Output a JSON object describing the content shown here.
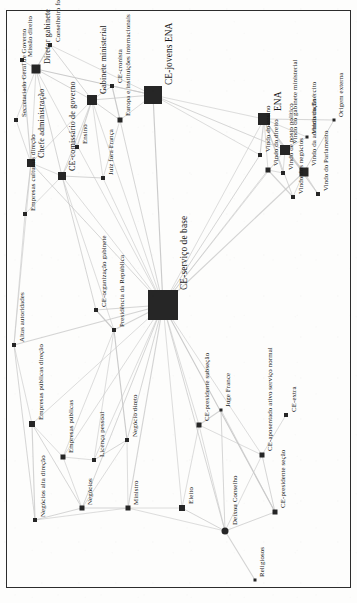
{
  "figure": {
    "type": "network-graph",
    "orientation_degrees": -90,
    "background_color": "#fdfdfc",
    "node_color": "#262626",
    "edge_color": "#c9c9c9",
    "frame_color": "#2c2c2c",
    "width": 357,
    "height": 603
  },
  "chart_data": {
    "type": "scatter",
    "title": "",
    "xlabel": "",
    "ylabel": "",
    "grid": false,
    "legend": "none",
    "nodes": [
      {
        "id": "missao-direito",
        "label": "Missão direito",
        "x": 22,
        "y": 60,
        "size": 4,
        "shape": "square",
        "label_size": "small",
        "lx": 27,
        "ly": 57
      },
      {
        "id": "secretariado-geral-governo",
        "label": "Secretariado Geral de Governo",
        "x": 16,
        "y": 120,
        "size": 4,
        "shape": "square",
        "label_size": "small",
        "lx": 21,
        "ly": 117
      },
      {
        "id": "chefe-administracao",
        "label": "Chefe administração",
        "x": 31,
        "y": 163,
        "size": 8,
        "shape": "square",
        "label_size": "med",
        "lx": 38,
        "ly": 158
      },
      {
        "id": "diretor-gabinete",
        "label": "Diretor gabinete",
        "x": 36,
        "y": 69,
        "size": 9,
        "shape": "square",
        "label_size": "med",
        "lx": 44,
        "ly": 64
      },
      {
        "id": "conselheiro-fora-ministerios",
        "label": "Conselheiro fora ministérios",
        "x": 50,
        "y": 45,
        "size": 4,
        "shape": "square",
        "label_size": "small",
        "lx": 55,
        "ly": 42
      },
      {
        "id": "empresas-culturais-direcao",
        "label": "Empresas culturais direção",
        "x": 25,
        "y": 214,
        "size": 4,
        "shape": "square",
        "label_size": "small",
        "lx": 30,
        "ly": 211
      },
      {
        "id": "ce-comissario-governo",
        "label": "CE-comissário de governo",
        "x": 62,
        "y": 176,
        "size": 8,
        "shape": "square",
        "label_size": "med",
        "lx": 69,
        "ly": 171
      },
      {
        "id": "ensino",
        "label": "Ensino",
        "x": 77,
        "y": 147,
        "size": 4,
        "shape": "square",
        "label_size": "small",
        "lx": 82,
        "ly": 144
      },
      {
        "id": "gabinete-ministerial",
        "label": "Gabinete ministerial",
        "x": 92,
        "y": 100,
        "size": 10,
        "shape": "square",
        "label_size": "med",
        "lx": 100,
        "ly": 94
      },
      {
        "id": "juiz-fora-franca",
        "label": "Juiz fora França",
        "x": 103,
        "y": 178,
        "size": 4,
        "shape": "square",
        "label_size": "small",
        "lx": 108,
        "ly": 175
      },
      {
        "id": "europa-instituicoes",
        "label": "Europa e instituições internacionais",
        "x": 120,
        "y": 120,
        "size": 5,
        "shape": "square",
        "label_size": "small",
        "lx": 125,
        "ly": 116
      },
      {
        "id": "ce-cronista",
        "label": "CE-cronista",
        "x": 112,
        "y": 86,
        "size": 4,
        "shape": "square",
        "label_size": "small",
        "lx": 117,
        "ly": 83
      },
      {
        "id": "ce-jovens-ena",
        "label": "CE-jovens ENA",
        "x": 153,
        "y": 95,
        "size": 18,
        "shape": "square",
        "label_size": "big",
        "lx": 165,
        "ly": 85
      },
      {
        "id": "ce-servico-de-base",
        "label": "CE-serviço de base",
        "x": 163,
        "y": 305,
        "size": 30,
        "shape": "square",
        "label_size": "big",
        "lx": 180,
        "ly": 290
      },
      {
        "id": "ce-organizacao-gabinete",
        "label": "CE-organização gabinete",
        "x": 96,
        "y": 310,
        "size": 4,
        "shape": "square",
        "label_size": "small",
        "lx": 101,
        "ly": 307
      },
      {
        "id": "presidencia-da-republica",
        "label": "Presidência da República",
        "x": 114,
        "y": 330,
        "size": 4,
        "shape": "square",
        "label_size": "small",
        "lx": 119,
        "ly": 327
      },
      {
        "id": "altas-autoridades",
        "label": "Altas autoridades",
        "x": 14,
        "y": 345,
        "size": 4,
        "shape": "square",
        "label_size": "small",
        "lx": 19,
        "ly": 342
      },
      {
        "id": "empresas-publicas-direcao",
        "label": "Empresas públicas direção",
        "x": 32,
        "y": 424,
        "size": 6,
        "shape": "square",
        "label_size": "small",
        "lx": 38,
        "ly": 420
      },
      {
        "id": "empresas-publicas",
        "label": "Empresas públicas",
        "x": 63,
        "y": 457,
        "size": 5,
        "shape": "square",
        "label_size": "small",
        "lx": 68,
        "ly": 453
      },
      {
        "id": "licenca-pessoal",
        "label": "Licença pessoal",
        "x": 94,
        "y": 460,
        "size": 4,
        "shape": "square",
        "label_size": "small",
        "lx": 99,
        "ly": 457
      },
      {
        "id": "negocio-direto",
        "label": "Negócio direto",
        "x": 127,
        "y": 440,
        "size": 4,
        "shape": "square",
        "label_size": "small",
        "lx": 132,
        "ly": 437
      },
      {
        "id": "negocios-alta-direcao",
        "label": "Negócios alta direção",
        "x": 35,
        "y": 520,
        "size": 4,
        "shape": "square",
        "label_size": "small",
        "lx": 40,
        "ly": 517
      },
      {
        "id": "negocios",
        "label": "Negócios",
        "x": 82,
        "y": 508,
        "size": 5,
        "shape": "square",
        "label_size": "small",
        "lx": 87,
        "ly": 505
      },
      {
        "id": "ministro",
        "label": "Ministro",
        "x": 128,
        "y": 508,
        "size": 5,
        "shape": "square",
        "label_size": "small",
        "lx": 133,
        "ly": 505
      },
      {
        "id": "eleito",
        "label": "Eleito",
        "x": 182,
        "y": 508,
        "size": 6,
        "shape": "square",
        "label_size": "small",
        "lx": 188,
        "ly": 504
      },
      {
        "id": "ce-presidente-subseccao",
        "label": "CE-presidente subseção",
        "x": 199,
        "y": 425,
        "size": 5,
        "shape": "square",
        "label_size": "small",
        "lx": 204,
        "ly": 421
      },
      {
        "id": "juge-france",
        "label": "Juge France",
        "x": 221,
        "y": 410,
        "size": 3,
        "shape": "square",
        "label_size": "small",
        "lx": 225,
        "ly": 407
      },
      {
        "id": "ce-aposentado-ativo",
        "label": "CE-aposentado ativo serviço normal",
        "x": 262,
        "y": 455,
        "size": 5,
        "shape": "square",
        "label_size": "small",
        "lx": 267,
        "ly": 451
      },
      {
        "id": "ce-extra",
        "label": "CE-extra",
        "x": 286,
        "y": 415,
        "size": 4,
        "shape": "square",
        "label_size": "small",
        "lx": 291,
        "ly": 412
      },
      {
        "id": "ce-presidente-seccao",
        "label": "CE-presidente seção",
        "x": 275,
        "y": 512,
        "size": 5,
        "shape": "square",
        "label_size": "small",
        "lx": 280,
        "ly": 508
      },
      {
        "id": "deixou-conselho",
        "label": "Deixou Conselho",
        "x": 225,
        "y": 531,
        "size": 7,
        "shape": "round",
        "label_size": "small",
        "lx": 232,
        "ly": 525
      },
      {
        "id": "religiosos",
        "label": "Religiosos",
        "x": 255,
        "y": 580,
        "size": 3,
        "shape": "square",
        "label_size": "small",
        "lx": 259,
        "ly": 577
      },
      {
        "id": "vindo-do-ensino",
        "label": "Vindo do ensino",
        "x": 260,
        "y": 155,
        "size": 4,
        "shape": "square",
        "label_size": "small",
        "lx": 265,
        "ly": 152
      },
      {
        "id": "vindo-do-direito",
        "label": "Vindo do direito",
        "x": 268,
        "y": 170,
        "size": 5,
        "shape": "square",
        "label_size": "small",
        "lx": 273,
        "ly": 166
      },
      {
        "id": "ena",
        "label": "ENA",
        "x": 264,
        "y": 119,
        "size": 12,
        "shape": "square",
        "label_size": "big",
        "lx": 274,
        "ly": 111
      },
      {
        "id": "vindo-gabinete-ministerial",
        "label": "Vindo do gabinete ministerial",
        "x": 285,
        "y": 150,
        "size": 10,
        "shape": "square",
        "label_size": "small",
        "lx": 292,
        "ly": 144
      },
      {
        "id": "vindo-posto-politico",
        "label": "Vindo de posto político",
        "x": 283,
        "y": 173,
        "size": 4,
        "shape": "square",
        "label_size": "small",
        "lx": 288,
        "ly": 170
      },
      {
        "id": "vindo-do-exercito",
        "label": "Vindo do Exército",
        "x": 307,
        "y": 137,
        "size": 3,
        "shape": "square",
        "label_size": "small",
        "lx": 311,
        "ly": 134
      },
      {
        "id": "vindo-da-administracao",
        "label": "Vindo da administração",
        "x": 304,
        "y": 172,
        "size": 9,
        "shape": "square",
        "label_size": "small",
        "lx": 311,
        "ly": 166
      },
      {
        "id": "vindo-dos-negocios",
        "label": "Vindo dos negócios",
        "x": 293,
        "y": 197,
        "size": 4,
        "shape": "square",
        "label_size": "small",
        "lx": 298,
        "ly": 194
      },
      {
        "id": "vindo-do-parlamento",
        "label": "Vindo do Parlamento",
        "x": 318,
        "y": 194,
        "size": 4,
        "shape": "square",
        "label_size": "small",
        "lx": 323,
        "ly": 191
      },
      {
        "id": "origem-externa",
        "label": "Origem externa",
        "x": 334,
        "y": 120,
        "size": 3,
        "shape": "square",
        "label_size": "small",
        "lx": 338,
        "ly": 117
      }
    ],
    "edges": [
      [
        "ce-servico-de-base",
        "ce-jovens-ena"
      ],
      [
        "ce-servico-de-base",
        "gabinete-ministerial"
      ],
      [
        "ce-servico-de-base",
        "ce-comissario-governo"
      ],
      [
        "ce-servico-de-base",
        "chefe-administracao"
      ],
      [
        "ce-servico-de-base",
        "diretor-gabinete"
      ],
      [
        "ce-servico-de-base",
        "presidencia-da-republica"
      ],
      [
        "ce-servico-de-base",
        "ce-organizacao-gabinete"
      ],
      [
        "ce-servico-de-base",
        "empresas-publicas-direcao"
      ],
      [
        "ce-servico-de-base",
        "empresas-publicas"
      ],
      [
        "ce-servico-de-base",
        "negocios"
      ],
      [
        "ce-servico-de-base",
        "ministro"
      ],
      [
        "ce-servico-de-base",
        "eleito"
      ],
      [
        "ce-servico-de-base",
        "deixou-conselho"
      ],
      [
        "ce-servico-de-base",
        "ce-presidente-subseccao"
      ],
      [
        "ce-servico-de-base",
        "ce-aposentado-ativo"
      ],
      [
        "ce-servico-de-base",
        "ce-presidente-seccao"
      ],
      [
        "ce-servico-de-base",
        "ena"
      ],
      [
        "ce-servico-de-base",
        "vindo-do-direito"
      ],
      [
        "ce-servico-de-base",
        "vindo-do-ensino"
      ],
      [
        "ce-servico-de-base",
        "vindo-gabinete-ministerial"
      ],
      [
        "ce-servico-de-base",
        "vindo-da-administracao"
      ],
      [
        "ce-servico-de-base",
        "europa-instituicoes"
      ],
      [
        "ce-servico-de-base",
        "juiz-fora-franca"
      ],
      [
        "ce-servico-de-base",
        "licenca-pessoal"
      ],
      [
        "ce-servico-de-base",
        "negocio-direto"
      ],
      [
        "ce-servico-de-base",
        "altas-autoridades"
      ],
      [
        "ce-jovens-ena",
        "ena"
      ],
      [
        "ce-jovens-ena",
        "gabinete-ministerial"
      ],
      [
        "ce-jovens-ena",
        "europa-instituicoes"
      ],
      [
        "ce-jovens-ena",
        "ce-cronista"
      ],
      [
        "ce-jovens-ena",
        "diretor-gabinete"
      ],
      [
        "ce-jovens-ena",
        "conselheiro-fora-ministerios"
      ],
      [
        "ce-jovens-ena",
        "vindo-do-ensino"
      ],
      [
        "ce-jovens-ena",
        "vindo-gabinete-ministerial"
      ],
      [
        "ena",
        "vindo-do-direito"
      ],
      [
        "ena",
        "vindo-do-ensino"
      ],
      [
        "ena",
        "vindo-posto-politico"
      ],
      [
        "ena",
        "vindo-gabinete-ministerial"
      ],
      [
        "ena",
        "vindo-da-administracao"
      ],
      [
        "ena",
        "vindo-dos-negocios"
      ],
      [
        "ena",
        "vindo-do-parlamento"
      ],
      [
        "ena",
        "vindo-do-exercito"
      ],
      [
        "ena",
        "origem-externa"
      ],
      [
        "vindo-gabinete-ministerial",
        "vindo-posto-politico"
      ],
      [
        "vindo-gabinete-ministerial",
        "vindo-do-exercito"
      ],
      [
        "vindo-gabinete-ministerial",
        "vindo-da-administracao"
      ],
      [
        "vindo-da-administracao",
        "vindo-dos-negocios"
      ],
      [
        "vindo-da-administracao",
        "vindo-do-parlamento"
      ],
      [
        "vindo-da-administracao",
        "origem-externa"
      ],
      [
        "vindo-do-direito",
        "vindo-posto-politico"
      ],
      [
        "vindo-do-direito",
        "vindo-dos-negocios"
      ],
      [
        "gabinete-ministerial",
        "diretor-gabinete"
      ],
      [
        "gabinete-ministerial",
        "chefe-administracao"
      ],
      [
        "gabinete-ministerial",
        "ce-comissario-governo"
      ],
      [
        "gabinete-ministerial",
        "conselheiro-fora-ministerios"
      ],
      [
        "gabinete-ministerial",
        "ensino"
      ],
      [
        "gabinete-ministerial",
        "juiz-fora-franca"
      ],
      [
        "gabinete-ministerial",
        "europa-instituicoes"
      ],
      [
        "gabinete-ministerial",
        "ce-cronista"
      ],
      [
        "diretor-gabinete",
        "chefe-administracao"
      ],
      [
        "diretor-gabinete",
        "conselheiro-fora-ministerios"
      ],
      [
        "diretor-gabinete",
        "missao-direito"
      ],
      [
        "diretor-gabinete",
        "secretariado-geral-governo"
      ],
      [
        "diretor-gabinete",
        "ce-comissario-governo"
      ],
      [
        "chefe-administracao",
        "secretariado-geral-governo"
      ],
      [
        "chefe-administracao",
        "missao-direito"
      ],
      [
        "chefe-administracao",
        "empresas-culturais-direcao"
      ],
      [
        "chefe-administracao",
        "ce-comissario-governo"
      ],
      [
        "chefe-administracao",
        "altas-autoridades"
      ],
      [
        "ce-comissario-governo",
        "ensino"
      ],
      [
        "ce-comissario-governo",
        "juiz-fora-franca"
      ],
      [
        "ce-comissario-governo",
        "empresas-culturais-direcao"
      ],
      [
        "ce-comissario-governo",
        "ce-organizacao-gabinete"
      ],
      [
        "ce-comissario-governo",
        "presidencia-da-republica"
      ],
      [
        "europa-instituicoes",
        "juiz-fora-franca"
      ],
      [
        "europa-instituicoes",
        "ce-cronista"
      ],
      [
        "altas-autoridades",
        "empresas-publicas-direcao"
      ],
      [
        "altas-autoridades",
        "empresas-culturais-direcao"
      ],
      [
        "altas-autoridades",
        "negocios-alta-direcao"
      ],
      [
        "empresas-publicas-direcao",
        "empresas-publicas"
      ],
      [
        "empresas-publicas-direcao",
        "negocios-alta-direcao"
      ],
      [
        "empresas-publicas-direcao",
        "negocios"
      ],
      [
        "empresas-publicas",
        "negocios"
      ],
      [
        "empresas-publicas",
        "licenca-pessoal"
      ],
      [
        "negocios",
        "negocios-alta-direcao"
      ],
      [
        "negocios",
        "ministro"
      ],
      [
        "negocios",
        "negocio-direto"
      ],
      [
        "licenca-pessoal",
        "negocio-direto"
      ],
      [
        "licenca-pessoal",
        "presidencia-da-republica"
      ],
      [
        "negocio-direto",
        "ministro"
      ],
      [
        "negocio-direto",
        "presidencia-da-republica"
      ],
      [
        "ministro",
        "eleito"
      ],
      [
        "ministro",
        "deixou-conselho"
      ],
      [
        "eleito",
        "deixou-conselho"
      ],
      [
        "eleito",
        "ce-presidente-subseccao"
      ],
      [
        "deixou-conselho",
        "religiosos"
      ],
      [
        "deixou-conselho",
        "ce-presidente-seccao"
      ],
      [
        "deixou-conselho",
        "ce-presidente-subseccao"
      ],
      [
        "deixou-conselho",
        "ce-aposentado-ativo"
      ],
      [
        "deixou-conselho",
        "juge-france"
      ],
      [
        "ce-presidente-subseccao",
        "juge-france"
      ],
      [
        "ce-presidente-subseccao",
        "ce-aposentado-ativo"
      ],
      [
        "ce-presidente-seccao",
        "ce-aposentado-ativo"
      ],
      [
        "ce-aposentado-ativo",
        "ce-extra"
      ],
      [
        "juge-france",
        "ce-presidente-seccao"
      ],
      [
        "presidencia-da-republica",
        "ce-organizacao-gabinete"
      ],
      [
        "negocios-alta-direcao",
        "ministro"
      ],
      [
        "empresas-publicas",
        "presidencia-da-republica"
      ]
    ]
  }
}
